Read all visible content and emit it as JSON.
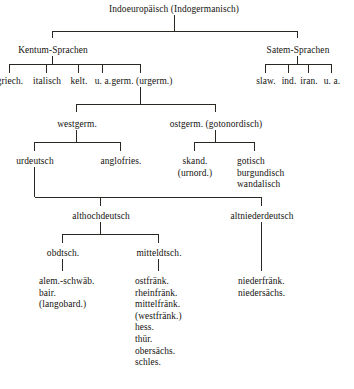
{
  "diagram": {
    "title": "Indoeuropäisch (Indogermanisch)",
    "type": "language-family-tree",
    "language": "de",
    "line_color": "#2a2622",
    "text_color": "#15130f",
    "background": "#ffffff"
  },
  "nodes": {
    "root": "Indoeuropäisch (Indogermanisch)",
    "kentum": "Kentum-Sprachen",
    "satem": "Satem-Sprachen",
    "kentum_children": {
      "griech": "griech.",
      "italisch": "italisch",
      "kelt": "kelt.",
      "ua": "u. a.",
      "germ": "germ. (urgerm.)"
    },
    "satem_children": {
      "slaw": "slaw.",
      "ind": "ind.",
      "iran": "iran.",
      "ua": "u. a."
    },
    "westgerm": "westgerm.",
    "ostgerm": "ostgerm. (gotonordisch)",
    "urdeutsch": "urdeutsch",
    "anglofries": "anglofries.",
    "skand": "skand.\n(urnord.)",
    "gotisch_group": "gotisch\nburgundisch\nwandalisch",
    "althochdeutsch": "althochdeutsch",
    "altniederdeutsch": "altniederdeutsch",
    "obdtsch": "obdtsch.",
    "mitteldtsch": "mitteldtsch.",
    "obdtsch_leaves": "alem.-schwäb.\nbair.\n(langobard.)",
    "mitteldtsch_leaves": "ostfränk.\nrheinfränk.\nmittelfränk.\n(westfränk.)\nhess.\nthür.\nobersächs.\nschles.",
    "altniederdeutsch_leaves": "niederfränk.\nniedersächs."
  },
  "edges": [
    {
      "from": "root",
      "to": "kentum"
    },
    {
      "from": "root",
      "to": "satem"
    },
    {
      "from": "kentum",
      "to": "griech."
    },
    {
      "from": "kentum",
      "to": "italisch"
    },
    {
      "from": "kentum",
      "to": "kelt."
    },
    {
      "from": "kentum",
      "to": "u. a."
    },
    {
      "from": "kentum",
      "to": "germ. (urgerm.)"
    },
    {
      "from": "satem",
      "to": "slaw."
    },
    {
      "from": "satem",
      "to": "ind."
    },
    {
      "from": "satem",
      "to": "iran."
    },
    {
      "from": "satem",
      "to": "u. a."
    },
    {
      "from": "germ. (urgerm.)",
      "to": "westgerm."
    },
    {
      "from": "germ. (urgerm.)",
      "to": "ostgerm. (gotonordisch)"
    },
    {
      "from": "westgerm.",
      "to": "urdeutsch"
    },
    {
      "from": "westgerm.",
      "to": "anglofries."
    },
    {
      "from": "ostgerm. (gotonordisch)",
      "to": "skand. (urnord.)"
    },
    {
      "from": "ostgerm. (gotonordisch)",
      "to": "gotisch burgundisch wandalisch"
    },
    {
      "from": "urdeutsch",
      "to": "althochdeutsch"
    },
    {
      "from": "urdeutsch",
      "to": "altniederdeutsch"
    },
    {
      "from": "althochdeutsch",
      "to": "obdtsch."
    },
    {
      "from": "althochdeutsch",
      "to": "mitteldtsch."
    },
    {
      "from": "obdtsch.",
      "to": "alem.-schwäb. bair. (langobard.)"
    },
    {
      "from": "mitteldtsch.",
      "to": "ostfränk. rheinfränk. mittelfränk. (westfränk.) hess. thür. obersächs. schles."
    },
    {
      "from": "altniederdeutsch",
      "to": "niederfränk. niedersächs."
    }
  ]
}
